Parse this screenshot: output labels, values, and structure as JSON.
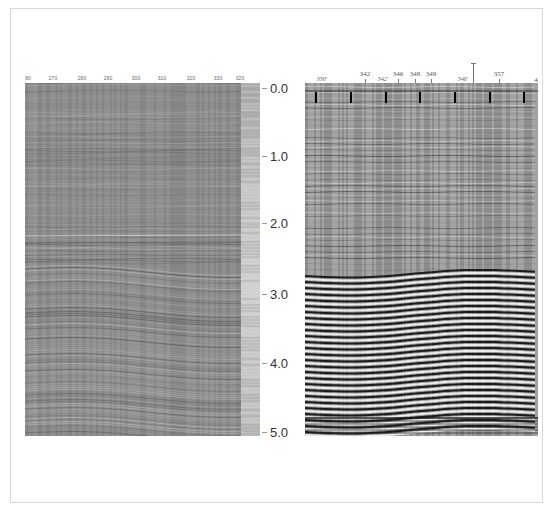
{
  "figure": {
    "left_section": {
      "description": "Raw/stacked seismic section, grayscale",
      "trace_labels": [
        {
          "text": "80",
          "x": 28
        },
        {
          "text": "270",
          "x": 53
        },
        {
          "text": "280",
          "x": 82
        },
        {
          "text": "290",
          "x": 108
        },
        {
          "text": "300",
          "x": 136
        },
        {
          "text": "310",
          "x": 162
        },
        {
          "text": "320",
          "x": 191
        },
        {
          "text": "330",
          "x": 218
        },
        {
          "text": "320",
          "x": 240
        }
      ]
    },
    "right_section": {
      "description": "Processed seismic section, high-contrast wiggle/variable area",
      "trace_labels": [
        {
          "text": "330'",
          "x": 322,
          "style": "italic",
          "y": 76
        },
        {
          "text": "342",
          "x": 365,
          "style": "normal",
          "y": 70
        },
        {
          "text": "342'",
          "x": 383,
          "style": "italic",
          "y": 76
        },
        {
          "text": "346",
          "x": 398,
          "style": "normal",
          "y": 70
        },
        {
          "text": "348",
          "x": 415,
          "style": "normal",
          "y": 70
        },
        {
          "text": "349",
          "x": 431,
          "style": "normal",
          "y": 70
        },
        {
          "text": "346'",
          "x": 463,
          "style": "italic",
          "y": 76
        },
        {
          "text": "357",
          "x": 499,
          "style": "normal",
          "y": 70
        },
        {
          "text": "4",
          "x": 536,
          "style": "normal",
          "y": 76
        }
      ],
      "tall_marker_x": 473,
      "vertical_marker_x": [
        316,
        351,
        386,
        420,
        455,
        490,
        524
      ]
    },
    "time_axis": {
      "unit": "s (two-way time)",
      "ticks": [
        {
          "label": "0.0",
          "y": 88
        },
        {
          "label": "1.0",
          "y": 156
        },
        {
          "label": "2.0",
          "y": 223
        },
        {
          "label": "3.0",
          "y": 294
        },
        {
          "label": "4.0",
          "y": 363
        },
        {
          "label": "5.0",
          "y": 432
        }
      ]
    }
  }
}
